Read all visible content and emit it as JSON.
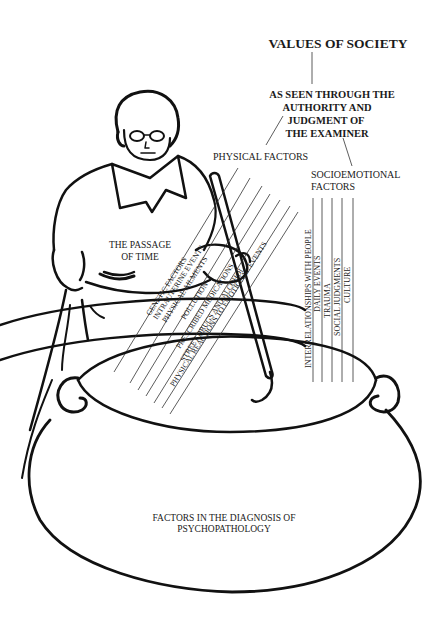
{
  "diagram": {
    "title": "VALUES OF SOCIETY",
    "subtitle_lines": [
      "AS SEEN THROUGH THE",
      "AUTHORITY AND",
      "JUDGMENT OF",
      "THE EXAMINER"
    ],
    "physical": {
      "label": "PHYSICAL  FACTORS",
      "items": [
        "GENETIC FACTORS",
        "INTRAUTERINE EVENTS",
        "PHYSICAL AILMENTS",
        "POLLUTION",
        "PRESCRIBED MEDICATIONS",
        "STREET DRUGS AND ALCOHOL",
        "PHYSICAL REACTIONS TO EMOTIONAL EVENTS"
      ]
    },
    "socioemotional": {
      "label_lines": [
        "SOCIOEMOTIONAL",
        "FACTORS"
      ],
      "items": [
        "INTERRELATIONSHIPS WITH PEOPLE",
        "DAILY EVENTS",
        "TRAUMA",
        "SOCIAL JUDGMENTS",
        "CULTURE"
      ]
    },
    "figure_label_lines": [
      "THE PASSAGE",
      "OF TIME"
    ],
    "cauldron_label_lines": [
      "FACTORS IN THE DIAGNOSIS OF",
      "PSYCHOPATHOLOGY"
    ],
    "colors": {
      "ink": "#111111",
      "background": "#ffffff"
    }
  }
}
